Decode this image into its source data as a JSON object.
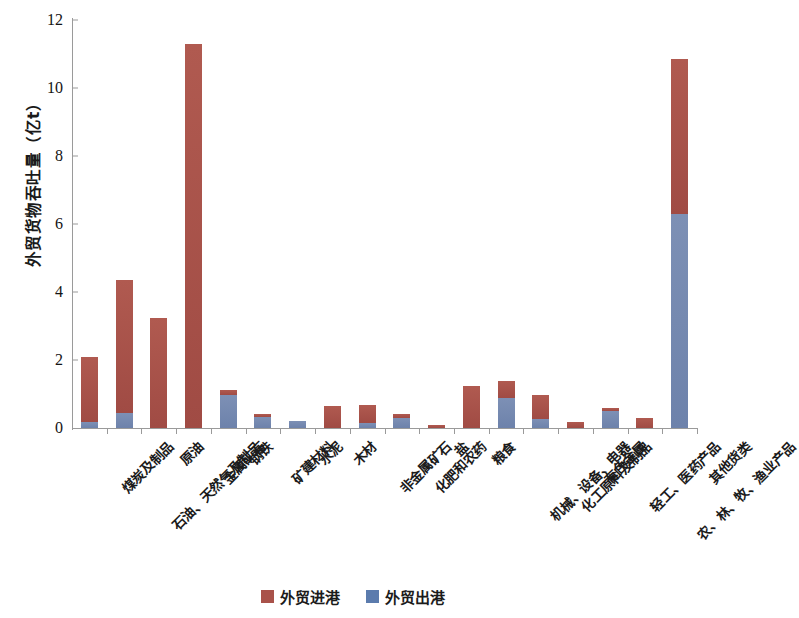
{
  "chart_data": {
    "type": "bar",
    "subtype": "stacked-vertical",
    "title": "",
    "xlabel": "",
    "ylabel": "外贸货物吞吐量（亿t）",
    "ylim": [
      0,
      12
    ],
    "yticks": [
      0,
      2,
      4,
      6,
      8,
      10,
      12
    ],
    "ytick_labels": [
      "0",
      "2",
      "4",
      "6",
      "8",
      "10",
      "12"
    ],
    "grid": false,
    "legend_position": "bottom-center",
    "categories": [
      "煤炭及制品",
      "石油、天然气及制品",
      "原油",
      "金属矿石",
      "钢铁",
      "矿建材料",
      "水泥",
      "木材",
      "非金属矿石",
      "化肥和农药",
      "盐",
      "粮食",
      "机械、设备、电器",
      "化工原料及制品",
      "有色金属",
      "轻工、医药产品",
      "农、林、牧、渔业产品",
      "其他货类"
    ],
    "series": [
      {
        "name": "外贸进港",
        "color": "#a9524a",
        "values": [
          1.92,
          3.91,
          3.24,
          11.29,
          0.15,
          0.07,
          0.0,
          0.65,
          0.52,
          0.1,
          0.08,
          1.23,
          0.5,
          0.72,
          0.18,
          0.08,
          0.3,
          4.55
        ]
      },
      {
        "name": "外贸出港",
        "color": "#5b7bad",
        "values": [
          0.17,
          0.45,
          0.0,
          0.0,
          0.98,
          0.33,
          0.22,
          0.0,
          0.16,
          0.3,
          0.0,
          0.0,
          0.88,
          0.26,
          0.0,
          0.5,
          0.0,
          6.3
        ]
      }
    ],
    "totals": [
      2.09,
      4.36,
      3.24,
      11.29,
      1.13,
      0.4,
      0.22,
      0.65,
      0.68,
      0.4,
      0.08,
      1.23,
      1.38,
      0.98,
      0.18,
      0.58,
      0.3,
      10.85
    ]
  },
  "legend": {
    "items": [
      {
        "label": "外贸进港",
        "color": "#a9524a"
      },
      {
        "label": "外贸出港",
        "color": "#5b7bad"
      }
    ]
  }
}
